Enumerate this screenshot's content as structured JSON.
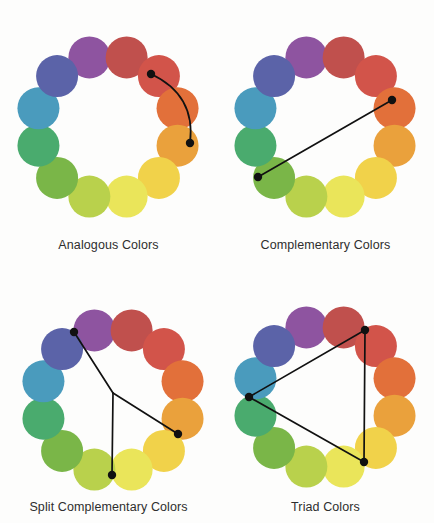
{
  "figure": {
    "background_color": "#fdfdfc",
    "line_color": "#111111",
    "caption_color": "#2e2e2e"
  },
  "wheel": {
    "segment_count": 12,
    "swatch_radius": 21,
    "ring_radius": 72,
    "start_angle_deg": -105,
    "colors": [
      "#8e54a0",
      "#c0504d",
      "#d2544a",
      "#e2703a",
      "#eaa13c",
      "#f1d24a",
      "#eae55a",
      "#b9d14c",
      "#7ab648",
      "#4aab6e",
      "#4a9bbd",
      "#5b63a8"
    ],
    "color_names": [
      "violet",
      "red-violet",
      "red",
      "red-orange",
      "orange",
      "yellow-orange",
      "yellow",
      "yellow-green",
      "green",
      "blue-green",
      "blue",
      "blue-violet"
    ]
  },
  "panels": [
    {
      "id": "analogous",
      "caption": "Analogous Colors",
      "scheme_type": "analogous",
      "connector_style": "arc",
      "origin": {
        "x": 0,
        "y": 0
      },
      "center": {
        "x": 108,
        "y": 127
      },
      "caption_y": 238,
      "selected_indices": [
        4,
        6
      ],
      "nodes": [
        {
          "x": 151,
          "y": 74
        },
        {
          "x": 190,
          "y": 143
        }
      ],
      "arc_control": {
        "x": 196,
        "y": 95
      }
    },
    {
      "id": "complementary",
      "caption": "Complementary Colors",
      "scheme_type": "complementary",
      "connector_style": "line",
      "origin": {
        "x": 217,
        "y": 0
      },
      "center": {
        "x": 325,
        "y": 127
      },
      "caption_y": 238,
      "selected_indices": [
        10,
        4
      ],
      "nodes": [
        {
          "x": 258,
          "y": 177
        },
        {
          "x": 392,
          "y": 100
        }
      ]
    },
    {
      "id": "split-complementary",
      "caption": "Split Complementary Colors",
      "scheme_type": "split-complementary",
      "connector_style": "fork",
      "origin": {
        "x": 0,
        "y": 261
      },
      "center": {
        "x": 113,
        "y": 400
      },
      "caption_y": 500,
      "selected_indices": [
        0,
        5,
        7
      ],
      "nodes": [
        {
          "x": 74,
          "y": 332
        },
        {
          "x": 178,
          "y": 434
        },
        {
          "x": 112,
          "y": 475
        }
      ],
      "fork_vertex": {
        "x": 113,
        "y": 393
      }
    },
    {
      "id": "triad",
      "caption": "Triad Colors",
      "scheme_type": "triad",
      "connector_style": "triangle",
      "origin": {
        "x": 217,
        "y": 261
      },
      "center": {
        "x": 325,
        "y": 397
      },
      "caption_y": 500,
      "selected_indices": [
        11,
        3,
        7
      ],
      "nodes": [
        {
          "x": 249,
          "y": 397
        },
        {
          "x": 365,
          "y": 330
        },
        {
          "x": 364,
          "y": 462
        }
      ]
    }
  ]
}
